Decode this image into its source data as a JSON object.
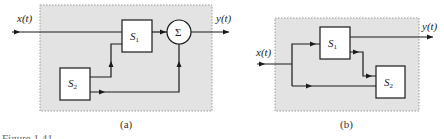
{
  "diagrams": [
    {
      "id": "a",
      "caption": "(a)",
      "input_label": "x(t)",
      "output_label": "y(t)",
      "blocks": [
        {
          "name": "S",
          "subscript": "1"
        },
        {
          "name": "S",
          "subscript": "2"
        }
      ],
      "summer_symbol": "Σ"
    },
    {
      "id": "b",
      "caption": "(b)",
      "input_label": "x(t)",
      "output_label": "y(t)",
      "blocks": [
        {
          "name": "S",
          "subscript": "1"
        },
        {
          "name": "S",
          "subscript": "2"
        }
      ]
    }
  ],
  "figure_caption_partial": "Figure 1.41",
  "colors": {
    "shade": "#e3e3e3",
    "line": "#1a1a1a",
    "dotted_border": "#9a9a9a"
  }
}
